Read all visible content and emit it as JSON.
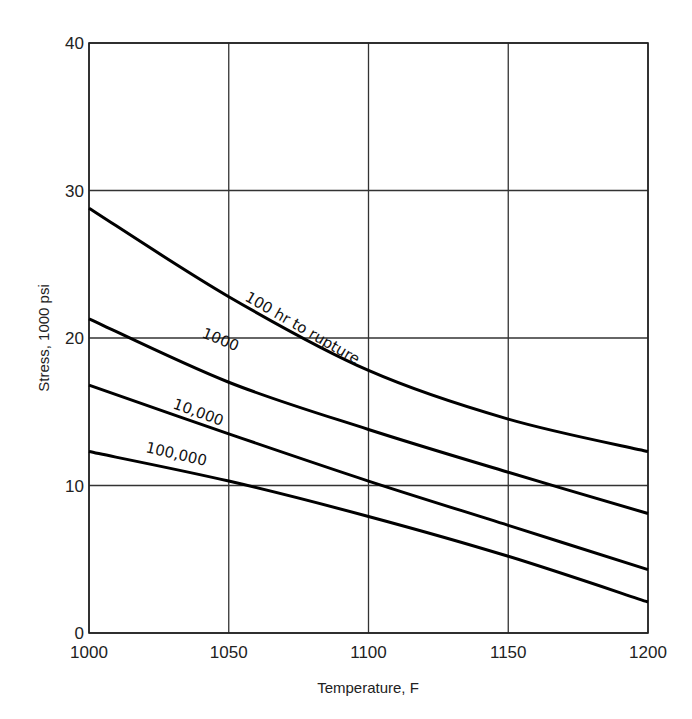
{
  "chart_data": {
    "type": "line",
    "title": "",
    "xlabel": "Temperature, F",
    "ylabel": "Stress, 1000 psi",
    "xlim": [
      1000,
      1200
    ],
    "ylim": [
      0,
      40
    ],
    "x_ticks": [
      "1000",
      "1050",
      "1100",
      "1150",
      "1200"
    ],
    "y_ticks": [
      "0",
      "10",
      "20",
      "30",
      "40"
    ],
    "grid": true,
    "legend": "inline curve labels",
    "x": [
      1000,
      1050,
      1100,
      1150,
      1200
    ],
    "series": [
      {
        "name": "100 hr to rupture",
        "label": "100 hr to rupture",
        "values": [
          28.8,
          22.8,
          17.8,
          14.5,
          12.3
        ]
      },
      {
        "name": "1000",
        "label": "1000",
        "values": [
          21.3,
          17.0,
          13.8,
          10.9,
          8.1
        ]
      },
      {
        "name": "10,000",
        "label": "10,000",
        "values": [
          16.8,
          13.5,
          10.3,
          7.3,
          4.3
        ]
      },
      {
        "name": "100,000",
        "label": "100,000",
        "values": [
          12.3,
          10.3,
          7.9,
          5.2,
          2.1
        ]
      }
    ]
  }
}
